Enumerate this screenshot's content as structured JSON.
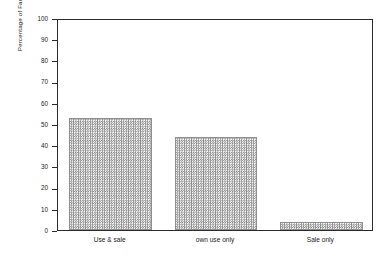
{
  "chart_data": {
    "type": "bar",
    "title": "",
    "subtitle": "",
    "xlabel": "",
    "ylabel": "Percentage of Farmers",
    "categories": [
      "Use & sale",
      "own use only",
      "Sale only"
    ],
    "values": [
      53,
      44,
      4
    ],
    "series": [
      {
        "name": "Percentage of Farmers",
        "values": [
          53,
          44,
          4
        ]
      }
    ],
    "ylim": [
      0,
      100
    ],
    "y_ticks": [
      0,
      10,
      20,
      30,
      40,
      50,
      60,
      70,
      80,
      90,
      100
    ],
    "y_tick_labels": [
      "0",
      "10",
      "20",
      "30",
      "40",
      "50",
      "60",
      "70",
      "80",
      "90",
      "100"
    ],
    "grid": false,
    "legend": false,
    "legend_position": "none",
    "annotations": [],
    "bar_fill": "#8a8a8a",
    "bar_fill_style": "checkerboard-dither",
    "bar_edge_color": "#8f8f8f",
    "axis_color": "#2b2b2b",
    "background_color": "#ffffff",
    "frame": "full-rectangle"
  }
}
